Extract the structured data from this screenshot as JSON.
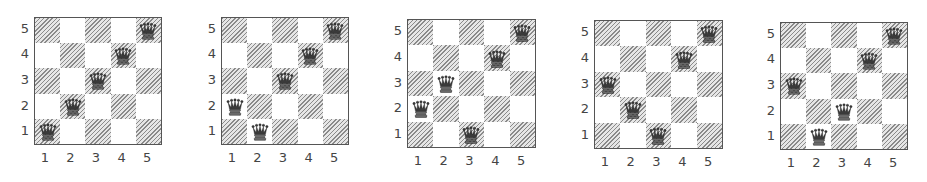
{
  "figure": {
    "rank_labels": [
      "5",
      "4",
      "3",
      "2",
      "1"
    ],
    "file_labels": [
      "1",
      "2",
      "3",
      "4",
      "5"
    ],
    "colors": {
      "border": "#555555",
      "hatch": "#8a8a8a",
      "light": "#ffffff",
      "label": "#444444"
    },
    "queen_icon": "queen-icon",
    "boards": [
      {
        "id": 1,
        "x": 34,
        "y": 17,
        "size": 128,
        "queens": [
          [
            1,
            1
          ],
          [
            2,
            2
          ],
          [
            3,
            3
          ],
          [
            4,
            4
          ],
          [
            5,
            5
          ]
        ]
      },
      {
        "id": 2,
        "x": 221,
        "y": 17,
        "size": 128,
        "queens": [
          [
            1,
            2
          ],
          [
            2,
            1
          ],
          [
            3,
            3
          ],
          [
            4,
            4
          ],
          [
            5,
            5
          ]
        ]
      },
      {
        "id": 3,
        "x": 407,
        "y": 19,
        "size": 129,
        "queens": [
          [
            1,
            2
          ],
          [
            2,
            3
          ],
          [
            3,
            1
          ],
          [
            4,
            4
          ],
          [
            5,
            5
          ]
        ]
      },
      {
        "id": 4,
        "x": 594,
        "y": 20,
        "size": 129,
        "queens": [
          [
            1,
            3
          ],
          [
            2,
            2
          ],
          [
            3,
            1
          ],
          [
            4,
            4
          ],
          [
            5,
            5
          ]
        ]
      },
      {
        "id": 5,
        "x": 780,
        "y": 22,
        "size": 128,
        "queens": [
          [
            1,
            3
          ],
          [
            2,
            1
          ],
          [
            3,
            2
          ],
          [
            4,
            4
          ],
          [
            5,
            5
          ]
        ]
      }
    ]
  }
}
